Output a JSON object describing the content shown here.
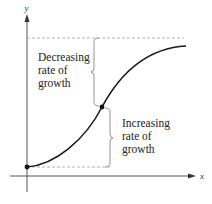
{
  "figure": {
    "axes": {
      "x_label": "x",
      "y_label": "y"
    },
    "regions": [
      {
        "name": "decreasing",
        "lines": [
          "Decreasing",
          "rate of",
          "growth"
        ]
      },
      {
        "name": "increasing",
        "lines": [
          "Increasing",
          "rate of",
          "growth"
        ]
      }
    ],
    "points": {
      "start": "start-point",
      "inflection": "inflection-point"
    },
    "colors": {
      "curve": "#1a1a1a",
      "axis": "#555555",
      "dashed": "#aaaaaa",
      "brace": "#888888",
      "text": "#222222"
    }
  }
}
